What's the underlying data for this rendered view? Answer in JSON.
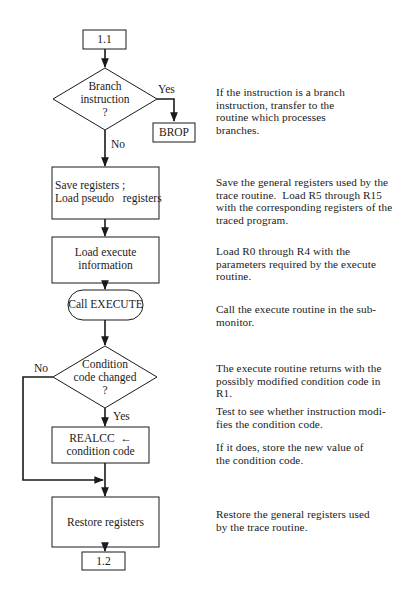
{
  "diagram": {
    "type": "flowchart",
    "nodes": {
      "start": {
        "shape": "connector-box",
        "label": "1.1"
      },
      "branch_decision": {
        "shape": "diamond",
        "lines": [
          "Branch",
          "instruction",
          "?"
        ]
      },
      "brop": {
        "shape": "box",
        "label": "BROP"
      },
      "save_registers": {
        "shape": "box",
        "lines": [
          "Save registers ;",
          "Load pseudo   registers"
        ]
      },
      "load_execute": {
        "shape": "box",
        "lines": [
          "Load execute",
          "information"
        ]
      },
      "call_execute": {
        "shape": "terminal",
        "label": "Call EXECUTE"
      },
      "cc_decision": {
        "shape": "diamond",
        "lines": [
          "Condition",
          "code changed",
          "?"
        ]
      },
      "realcc": {
        "shape": "box",
        "lines": [
          "REALCC  ←",
          "condition code"
        ]
      },
      "restore_registers": {
        "shape": "box",
        "label": "Restore registers"
      },
      "end": {
        "shape": "connector-box",
        "label": "1.2"
      }
    },
    "edge_labels": {
      "branch_yes": "Yes",
      "branch_no": "No",
      "cc_no": "No",
      "cc_yes": "Yes"
    },
    "edges": [
      {
        "from": "start",
        "to": "branch_decision"
      },
      {
        "from": "branch_decision",
        "to": "brop",
        "label": "Yes"
      },
      {
        "from": "branch_decision",
        "to": "save_registers",
        "label": "No"
      },
      {
        "from": "save_registers",
        "to": "load_execute"
      },
      {
        "from": "load_execute",
        "to": "call_execute"
      },
      {
        "from": "call_execute",
        "to": "cc_decision"
      },
      {
        "from": "cc_decision",
        "to": "realcc",
        "label": "Yes"
      },
      {
        "from": "cc_decision",
        "to": "restore_registers",
        "label": "No"
      },
      {
        "from": "realcc",
        "to": "restore_registers"
      },
      {
        "from": "restore_registers",
        "to": "end"
      }
    ]
  },
  "descriptions": {
    "branch": [
      "If the instruction is a branch",
      "instruction, transfer to the",
      "routine which processes",
      "branches."
    ],
    "save": [
      "Save the general registers used by the",
      "trace routine.  Load R5 through R15",
      "with the corresponding registers of the",
      "traced program."
    ],
    "load": [
      "Load R0 through R4 with the",
      "parameters required by the execute",
      "routine."
    ],
    "call": [
      "Call the execute routine in the sub-",
      "monitor."
    ],
    "returns": [
      "The execute routine returns with the",
      "possibly modified condition code in",
      "R1."
    ],
    "test": [
      "Test to see whether instruction modi-",
      "fies the condition code."
    ],
    "store": [
      "If it does, store the new value of",
      "the condition code."
    ],
    "restore": [
      "Restore the general registers used",
      "by the trace routine."
    ]
  }
}
